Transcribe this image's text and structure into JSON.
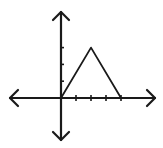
{
  "diagram": {
    "origin_px": [
      61,
      98
    ],
    "unit_px": 15,
    "axes": {
      "x_arrow_left": [
        10,
        98
      ],
      "x_arrow_right": [
        155,
        98
      ],
      "y_arrow_top": [
        61,
        12
      ],
      "y_arrow_bottom": [
        61,
        140
      ]
    },
    "x_ticks": [
      1,
      2,
      3,
      4
    ],
    "y_ticks": [
      1,
      2,
      3
    ],
    "triangle_points": [
      [
        0,
        0
      ],
      [
        2,
        3
      ],
      [
        4,
        0
      ]
    ],
    "stroke_color": "#1a1a1a",
    "background": "#ffffff"
  }
}
